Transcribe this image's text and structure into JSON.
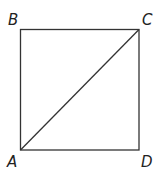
{
  "figure": {
    "type": "square-with-diagonal",
    "vertices": {
      "A": {
        "label": "A",
        "position": "bottom-left"
      },
      "B": {
        "label": "B",
        "position": "top-left"
      },
      "C": {
        "label": "C",
        "position": "top-right"
      },
      "D": {
        "label": "D",
        "position": "bottom-right"
      }
    },
    "diagonal": "AC",
    "colors": {
      "stroke": "#333333",
      "label": "#222222",
      "background": "#ffffff"
    }
  }
}
